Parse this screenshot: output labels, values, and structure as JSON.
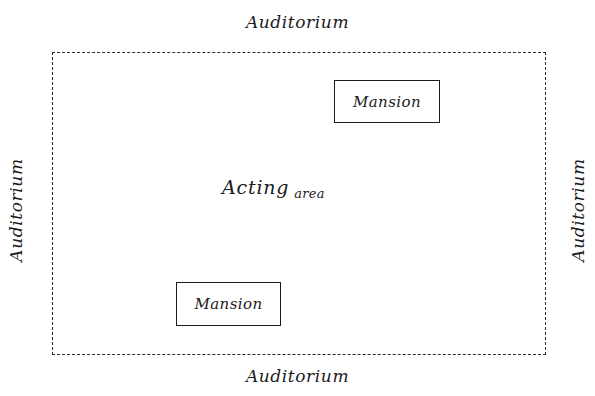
{
  "diagram": {
    "ink_color": "#1b1b1b",
    "background_color": "#ffffff",
    "acting_area": {
      "caption_primary": "Acting",
      "caption_secondary": "area",
      "border_style": "dashed"
    },
    "mansions": [
      {
        "label": "Mansion",
        "position": "upper-right"
      },
      {
        "label": "Mansion",
        "position": "lower-left"
      }
    ],
    "auditorium_labels": {
      "top": "Auditorium",
      "bottom": "Auditorium",
      "left": "Auditorium",
      "right": "Auditorium"
    }
  }
}
